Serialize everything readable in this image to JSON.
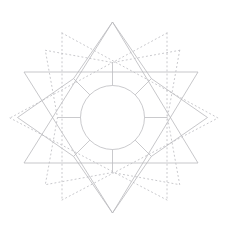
{
  "figure": {
    "width": 230,
    "height": 231,
    "background_color": "#ffffff",
    "center": {
      "x": 112.5,
      "y": 117.5
    },
    "line_colors": {
      "solid_star": "#b9b9bd",
      "dotted_star": "#c2c2c6",
      "circle": "#bcbcc0",
      "spokes": "#bcbcc0"
    },
    "inner_circle": {
      "name": "inner-circle",
      "cx": 112.5,
      "cy": 117.5,
      "r": 32,
      "style": "solid"
    },
    "solid_star": {
      "name": "solid-four-point-star",
      "style": "solid",
      "point_count": 4,
      "outer_radius": 95,
      "inner_radius": 55,
      "rotation_deg": 0,
      "apex_points": [
        {
          "label": "top",
          "x": 112.5,
          "y": 22
        },
        {
          "label": "right",
          "x": 207.5,
          "y": 117.5
        },
        {
          "label": "bottom",
          "x": 112.5,
          "y": 213
        },
        {
          "label": "left",
          "x": 17.5,
          "y": 117.5
        }
      ],
      "polyline": "112.5,22 151.4,78.6 207.5,117.5 151.4,156.4 112.5,213 73.6,156.4 17.5,117.5 73.6,78.6 112.5,22"
    },
    "dotted_star": {
      "name": "dotted-four-point-star",
      "style": "dotted",
      "point_count": 4,
      "outer_radius": 95,
      "inner_radius": 55,
      "rotation_deg": 45,
      "apex_points": [
        {
          "label": "top-right",
          "x": 179.7,
          "y": 50.3
        },
        {
          "label": "bottom-right",
          "x": 179.7,
          "y": 184.7
        },
        {
          "label": "bottom-left",
          "x": 45.3,
          "y": 184.7
        },
        {
          "label": "top-left",
          "x": 45.3,
          "y": 50.3
        }
      ],
      "polyline": "179.7,50.3 167.5,117.5 179.7,184.7 112.5,172.5 45.3,184.7 57.5,117.5 45.3,50.3 112.5,62.5 179.7,50.3"
    },
    "chords": {
      "name": "star-chord-lines",
      "description": "long straight chords joining opposite star apexes",
      "solid_chords": [
        {
          "from": [
            24,
            72
          ],
          "to": [
            198,
            72
          ],
          "orientation": "horizontal-upper"
        },
        {
          "from": [
            24,
            163
          ],
          "to": [
            198,
            163
          ],
          "orientation": "horizontal-lower"
        },
        {
          "from": [
            112.5,
            22
          ],
          "to": [
            24,
            163
          ],
          "orientation": "diagonal"
        },
        {
          "from": [
            112.5,
            22
          ],
          "to": [
            198,
            163
          ],
          "orientation": "diagonal"
        },
        {
          "from": [
            112.5,
            213
          ],
          "to": [
            24,
            72
          ],
          "orientation": "diagonal"
        },
        {
          "from": [
            112.5,
            213
          ],
          "to": [
            198,
            72
          ],
          "orientation": "diagonal"
        }
      ],
      "dotted_chords": [
        {
          "from": [
            62,
            33
          ],
          "to": [
            62,
            200
          ],
          "orientation": "vertical-left"
        },
        {
          "from": [
            167,
            33
          ],
          "to": [
            167,
            200
          ],
          "orientation": "vertical-right"
        },
        {
          "from": [
            62,
            33
          ],
          "to": [
            218,
            118
          ],
          "orientation": "diagonal"
        },
        {
          "from": [
            167,
            33
          ],
          "to": [
            10,
            118
          ],
          "orientation": "diagonal"
        },
        {
          "from": [
            62,
            200
          ],
          "to": [
            218,
            118
          ],
          "orientation": "diagonal"
        },
        {
          "from": [
            167,
            200
          ],
          "to": [
            10,
            118
          ],
          "orientation": "diagonal"
        }
      ]
    },
    "spokes": {
      "name": "radial-spokes",
      "description": "short radial segments from inner circle outward to star valleys",
      "segments": [
        {
          "angle_deg": -90,
          "from": [
            112.5,
            85.5
          ],
          "to": [
            112.5,
            62.5
          ]
        },
        {
          "angle_deg": -45,
          "from": [
            135.1,
            94.9
          ],
          "to": [
            151.4,
            78.6
          ]
        },
        {
          "angle_deg": 0,
          "from": [
            144.5,
            117.5
          ],
          "to": [
            167.5,
            117.5
          ]
        },
        {
          "angle_deg": 45,
          "from": [
            135.1,
            140.1
          ],
          "to": [
            151.4,
            156.4
          ]
        },
        {
          "angle_deg": 90,
          "from": [
            112.5,
            149.5
          ],
          "to": [
            112.5,
            172.5
          ]
        },
        {
          "angle_deg": 135,
          "from": [
            89.9,
            140.1
          ],
          "to": [
            73.6,
            156.4
          ]
        },
        {
          "angle_deg": 180,
          "from": [
            80.5,
            117.5
          ],
          "to": [
            57.5,
            117.5
          ]
        },
        {
          "angle_deg": 225,
          "from": [
            89.9,
            94.9
          ],
          "to": [
            73.6,
            78.6
          ]
        }
      ]
    }
  }
}
